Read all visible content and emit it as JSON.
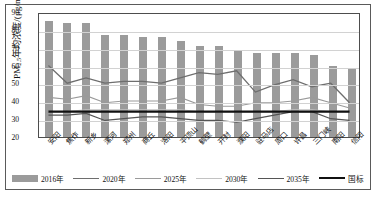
{
  "chart_data": {
    "type": "bar",
    "title": "",
    "xlabel": "",
    "ylabel": "PM2.5年均浓度/(μg/m³)",
    "ylim": [
      20,
      90
    ],
    "yticks": [
      20,
      30,
      40,
      50,
      60,
      70,
      80,
      90
    ],
    "grid": true,
    "legend_position": "bottom",
    "categories": [
      "安阳",
      "焦作",
      "新乡",
      "漯河",
      "郑州",
      "商丘",
      "洛阳",
      "平顶山",
      "鹤壁",
      "开封",
      "濮阳",
      "驻马店",
      "周口",
      "许昌",
      "三门峡",
      "南阳",
      "信阳"
    ],
    "series": [
      {
        "name": "2016年",
        "type": "bar",
        "color": "#9b9b9b",
        "values": [
          85,
          84,
          84,
          77,
          77,
          76,
          76,
          74,
          71,
          71,
          68,
          67,
          67,
          67,
          66,
          60,
          58
        ]
      },
      {
        "name": "2020年",
        "type": "line",
        "color": "#6e6e6e",
        "width": 1.3,
        "values": [
          61,
          51,
          54,
          51,
          52,
          52,
          51,
          54,
          57,
          56,
          58,
          46,
          50,
          53,
          49,
          51,
          40
        ]
      },
      {
        "name": "2025年",
        "type": "line",
        "color": "#9a9a9a",
        "width": 1.1,
        "values": [
          43,
          42,
          44,
          40,
          41,
          41,
          41,
          43,
          39,
          38,
          38,
          40,
          40,
          41,
          43,
          40,
          37
        ]
      },
      {
        "name": "2030年",
        "type": "line",
        "color": "#c2c2c2",
        "width": 1.1,
        "values": [
          35,
          35,
          36,
          36,
          36,
          36,
          36,
          36,
          35,
          35,
          35,
          35,
          35,
          36,
          36,
          35,
          35
        ]
      },
      {
        "name": "2035年",
        "type": "line",
        "color": "#555555",
        "width": 1.2,
        "values": [
          33,
          33,
          34,
          30,
          31,
          32,
          32,
          31,
          30,
          30,
          29,
          31,
          33,
          35,
          35,
          31,
          30
        ]
      },
      {
        "name": "国标",
        "type": "line",
        "color": "#111111",
        "width": 2.2,
        "values": [
          35,
          35,
          35,
          35,
          35,
          35,
          35,
          35,
          35,
          35,
          35,
          35,
          35,
          35,
          35,
          35,
          35
        ]
      }
    ],
    "legend": [
      {
        "label": "2016年",
        "kind": "bar",
        "color": "#9b9b9b",
        "width": 7
      },
      {
        "label": "2020年",
        "kind": "line",
        "color": "#6e6e6e",
        "width": 1.3
      },
      {
        "label": "2025年",
        "kind": "line",
        "color": "#9a9a9a",
        "width": 1.1
      },
      {
        "label": "2030年",
        "kind": "line",
        "color": "#c2c2c2",
        "width": 1.2
      },
      {
        "label": "2035年",
        "kind": "line",
        "color": "#555555",
        "width": 1.4
      },
      {
        "label": "国标",
        "kind": "line",
        "color": "#111111",
        "width": 2.4
      }
    ]
  }
}
